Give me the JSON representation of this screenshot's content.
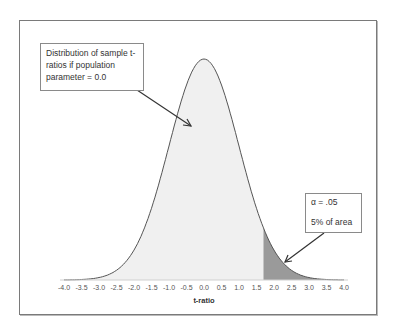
{
  "chart_data": {
    "type": "area",
    "title": "",
    "xlabel": "t-ratio",
    "ylabel": "",
    "xlim": [
      -4.0,
      4.0
    ],
    "x_ticks": [
      "-4.0",
      "-3.5",
      "-3.0",
      "-2.5",
      "-2.0",
      "-1.5",
      "-1.0",
      "-0.5",
      "0.0",
      "0.5",
      "1.0",
      "1.5",
      "2.0",
      "2.5",
      "3.0",
      "3.5",
      "4.0"
    ],
    "distribution": "t (approximately standard normal), mean 0.0",
    "critical_value": 1.7,
    "shaded_tail": {
      "from": 1.7,
      "to": 4.0,
      "area_percent": 5
    },
    "grid": false,
    "legend": "none",
    "annotations": [
      {
        "text": "Distribution of sample t-ratios if population parameter = 0.0",
        "points_to": "curve body"
      },
      {
        "alpha": "α = .05",
        "area": "5% of area",
        "points_to": "right tail"
      }
    ],
    "colors": {
      "body_fill": "#f0f0f0",
      "tail_fill": "#9a9a9a",
      "curve": "#555555"
    }
  },
  "callouts": {
    "main": "Distribution of sample t-ratios if population parameter = 0.0",
    "alpha_line": "α = .05",
    "area_line": "5% of area"
  },
  "axis": {
    "xlabel": "t-ratio",
    "ticks": [
      "-4.0",
      "-3.5",
      "-3.0",
      "-2.5",
      "-2.0",
      "-1.5",
      "-1.0",
      "-0.5",
      "0.0",
      "0.5",
      "1.0",
      "1.5",
      "2.0",
      "2.5",
      "3.0",
      "3.5",
      "4.0"
    ]
  }
}
